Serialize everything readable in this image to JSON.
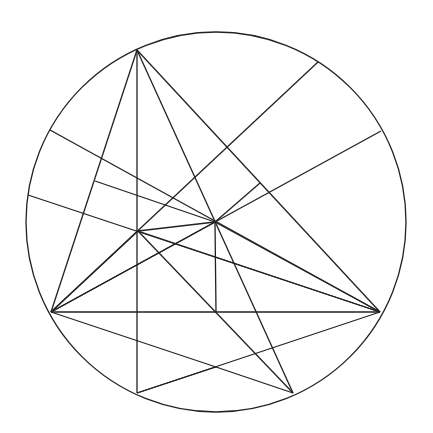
{
  "diagram": {
    "title": "",
    "stroke_color": "#222222",
    "background": "#ffffff",
    "circle": {
      "cx": 216,
      "cy": 222,
      "r": 190
    },
    "points": {
      "A": [
        137,
        50
      ],
      "B": [
        51,
        312
      ],
      "C": [
        380,
        312
      ],
      "H": [
        138,
        231
      ],
      "O": [
        215,
        222
      ],
      "M": [
        216,
        312
      ],
      "D": [
        137,
        393
      ],
      "E": [
        293,
        393
      ],
      "P1": [
        50,
        130
      ],
      "P2": [
        28,
        195
      ],
      "P3": [
        318,
        62
      ],
      "P4": [
        381,
        131
      ],
      "F1": [
        95,
        181
      ],
      "F2": [
        260,
        183
      ],
      "S": [
        216,
        367
      ]
    },
    "segments": [
      [
        "A",
        "B"
      ],
      [
        "A",
        "C"
      ],
      [
        "B",
        "C"
      ],
      [
        "A",
        "D"
      ],
      [
        "A",
        "E"
      ],
      [
        "B",
        "H"
      ],
      [
        "B",
        "O"
      ],
      [
        "H",
        "O"
      ],
      [
        "H",
        "C"
      ],
      [
        "O",
        "C"
      ],
      [
        "B",
        "P3"
      ],
      [
        "B",
        "P4"
      ],
      [
        "P1",
        "C"
      ],
      [
        "P2",
        "C"
      ],
      [
        "F1",
        "O"
      ],
      [
        "O",
        "F2"
      ],
      [
        "O",
        "M"
      ],
      [
        "H",
        "E"
      ],
      [
        "B",
        "S"
      ],
      [
        "S",
        "E"
      ],
      [
        "D",
        "S"
      ],
      [
        "D",
        "C"
      ]
    ]
  }
}
